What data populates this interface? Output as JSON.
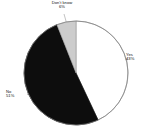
{
  "chart_data": {
    "type": "pie",
    "title": "",
    "subtitle": "",
    "xlabel": "",
    "ylabel": "",
    "legend_position": "none",
    "grid": false,
    "labels_show_percent": true,
    "categories": [
      "Yes",
      "No",
      "Don't know"
    ],
    "values": [
      43,
      51,
      6
    ],
    "slices": [
      {
        "name": "Yes",
        "label": "Yes",
        "percent": 43,
        "percent_text": "43%",
        "color": "#ffffff",
        "stroke": "#808080",
        "start_angle_deg": 0,
        "end_angle_deg": 154.8,
        "label_position": "right"
      },
      {
        "name": "No",
        "label": "No",
        "percent": 51,
        "percent_text": "51%",
        "color": "#0d0d0d",
        "stroke": "#0d0d0d",
        "start_angle_deg": 154.8,
        "end_angle_deg": 338.4,
        "label_position": "left"
      },
      {
        "name": "Don't know",
        "label": "Don't know",
        "percent": 6,
        "percent_text": "6%",
        "color": "#cccccc",
        "stroke": "#9a9a9a",
        "start_angle_deg": 338.4,
        "end_angle_deg": 360,
        "label_position": "top"
      }
    ],
    "geometry": {
      "center_x": 76,
      "center_y": 73,
      "radius": 52
    },
    "colors": {
      "background": "#ffffff",
      "text": "#111111",
      "outline": "#808080",
      "leader_line": "#9a9a9a"
    }
  }
}
